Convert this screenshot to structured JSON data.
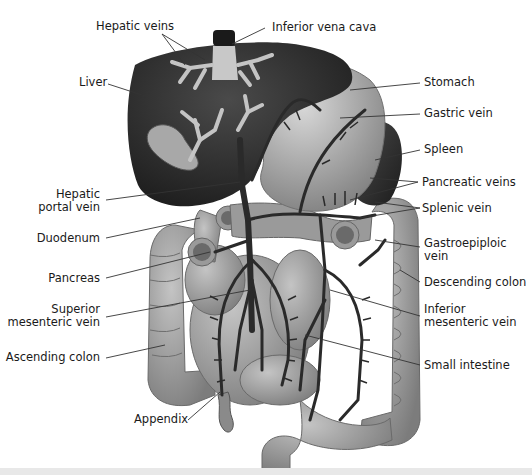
{
  "diagram": {
    "labels": {
      "hepatic_veins": "Hepatic veins",
      "inferior_vena_cava": "Inferior vena cava",
      "liver": "Liver",
      "stomach": "Stomach",
      "gastric_vein": "Gastric vein",
      "spleen": "Spleen",
      "hepatic_portal_vein_1": "Hepatic",
      "hepatic_portal_vein_2": "portal vein",
      "pancreatic_veins": "Pancreatic veins",
      "splenic_vein": "Splenic vein",
      "duodenum": "Duodenum",
      "gastroepiploic_vein_1": "Gastroepiploic",
      "gastroepiploic_vein_2": "vein",
      "pancreas": "Pancreas",
      "descending_colon": "Descending colon",
      "superior_mesenteric_vein_1": "Superior",
      "superior_mesenteric_vein_2": "mesenteric vein",
      "inferior_mesenteric_vein_1": "Inferior",
      "inferior_mesenteric_vein_2": "mesenteric vein",
      "ascending_colon": "Ascending colon",
      "small_intestine": "Small intestine",
      "appendix": "Appendix"
    },
    "colors": {
      "liver": "#2e2e2e",
      "organ_gray": "#9a9a9a",
      "vein": "#2a2a2a",
      "vein_light": "#c8c8c8",
      "leader_line": "#333333"
    }
  }
}
